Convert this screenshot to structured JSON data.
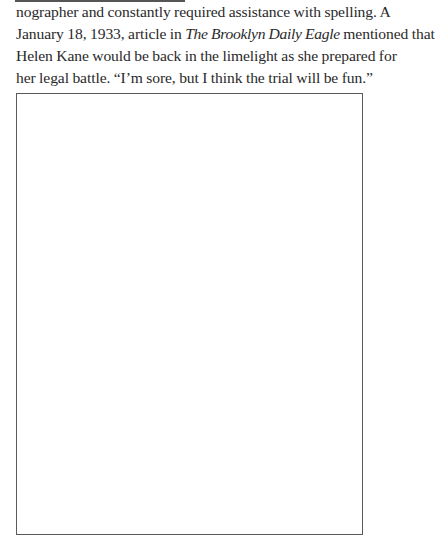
{
  "document": {
    "top_rule": true,
    "paragraph": {
      "lines": [
        {
          "text": "nographer and constantly required assistance with spelling. A"
        },
        {
          "pre": "January 18, 1933, article in ",
          "italic": "The Brooklyn Daily Eagle",
          "post": " mentioned that"
        },
        {
          "text": "Helen Kane would be back in the limelight as she prepared for"
        },
        {
          "text": "her legal battle. “I’m sore, but I think the trial will be fun.”"
        }
      ]
    },
    "figure": {
      "type": "empty-image-placeholder",
      "border_color": "#5a5a5a"
    }
  }
}
